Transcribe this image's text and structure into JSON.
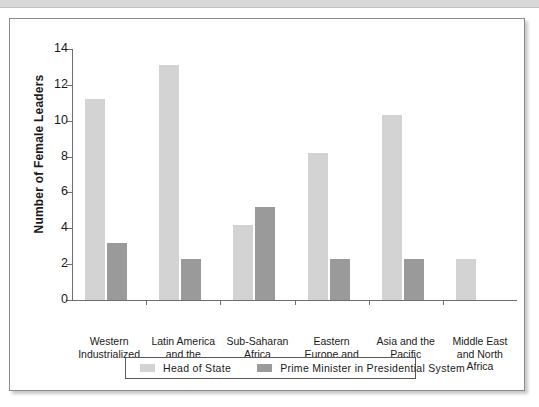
{
  "chart_data": {
    "type": "bar",
    "title": "",
    "xlabel": "",
    "ylabel": "Number of Female Leaders",
    "ylim": [
      0,
      14
    ],
    "yticks": [
      0,
      2,
      4,
      6,
      8,
      10,
      12,
      14
    ],
    "grid": false,
    "legend_position": "bottom",
    "categories": [
      "Western\nIndustrialized",
      "Latin America\nand the\nCaribbean",
      "Sub-Saharan\nAfrica",
      "Eastern\nEurope and\nCentral Asia",
      "Asia and the\nPacific",
      "Middle East\nand North\nAfrica"
    ],
    "category_lines": [
      [
        "Western",
        "Industrialized"
      ],
      [
        "Latin America",
        "and the",
        "Caribbean"
      ],
      [
        "Sub-Saharan",
        "Africa"
      ],
      [
        "Eastern",
        "Europe and",
        "Central Asia"
      ],
      [
        "Asia and the",
        "Pacific"
      ],
      [
        "Middle East",
        "and North",
        "Africa"
      ]
    ],
    "series": [
      {
        "name": "Head of State",
        "color": "#d3d3d3",
        "values": [
          11.2,
          13.1,
          4.2,
          8.2,
          10.3,
          2.3
        ]
      },
      {
        "name": "Prime Minister in Presidential System",
        "color": "#9a9a9a",
        "values": [
          3.2,
          2.3,
          5.2,
          2.3,
          2.3,
          0
        ]
      }
    ]
  },
  "colors": {
    "series_light": "#d3d3d3",
    "series_dark": "#9a9a9a",
    "axis": "#6e6e6e",
    "text": "#1a1a1a",
    "frame": "#8a8a8a"
  }
}
